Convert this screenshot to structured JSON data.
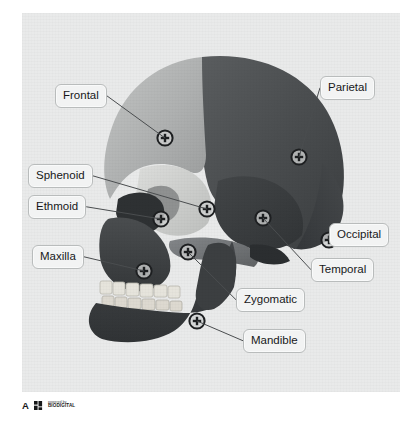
{
  "figure": {
    "panel_letter": "A",
    "attribution": {
      "line1": "powered by",
      "line2": "BIODIGITAL"
    },
    "background_color": "#e9eaea"
  },
  "palette": {
    "frontal": "#b0b2b2",
    "parietal": "#4c4f51",
    "occipital": "#404345",
    "temporal": "#3b3e40",
    "sphenoid": "#cfd0cf",
    "ethmoid": "#8d8f8f",
    "maxilla": "#3f4244",
    "zygomatic": "#6f7274",
    "mandible": "#3a3d3f",
    "teeth": "#e4e2da",
    "label_fill": "#f2f3f3",
    "label_border": "#b9bcbc",
    "leader_line": "#4a4d4f",
    "marker_stroke": "#1d1f21"
  },
  "labels": [
    {
      "id": "frontal",
      "text": "Frontal",
      "box": {
        "x": 55,
        "y": 84
      },
      "anchor": {
        "x": 113,
        "y": 98
      },
      "marker": {
        "x": 143,
        "y": 125
      }
    },
    {
      "id": "parietal",
      "text": "Parietal",
      "box": {
        "x": 320,
        "y": 76
      },
      "anchor": {
        "x": 320,
        "y": 92
      },
      "marker": {
        "x": 277,
        "y": 144
      }
    },
    {
      "id": "sphenoid",
      "text": "Sphenoid",
      "box": {
        "x": 28,
        "y": 164
      },
      "anchor": {
        "x": 100,
        "y": 178
      },
      "marker": {
        "x": 185,
        "y": 196
      }
    },
    {
      "id": "ethmoid",
      "text": "Ethmoid",
      "box": {
        "x": 28,
        "y": 195
      },
      "anchor": {
        "x": 94,
        "y": 209
      },
      "marker": {
        "x": 139,
        "y": 206
      }
    },
    {
      "id": "maxilla",
      "text": "Maxilla",
      "box": {
        "x": 32,
        "y": 245
      },
      "anchor": {
        "x": 90,
        "y": 259
      },
      "marker": {
        "x": 122,
        "y": 258
      }
    },
    {
      "id": "occipital",
      "text": "Occipital",
      "box": {
        "x": 329,
        "y": 223
      },
      "anchor": {
        "x": 329,
        "y": 237
      },
      "marker": {
        "x": 307,
        "y": 227
      }
    },
    {
      "id": "temporal",
      "text": "Temporal",
      "box": {
        "x": 311,
        "y": 258
      },
      "anchor": {
        "x": 311,
        "y": 272
      },
      "marker": {
        "x": 241,
        "y": 205
      }
    },
    {
      "id": "zygomatic",
      "text": "Zygomatic",
      "box": {
        "x": 236,
        "y": 288
      },
      "anchor": {
        "x": 236,
        "y": 302
      },
      "marker": {
        "x": 166,
        "y": 239
      }
    },
    {
      "id": "mandible",
      "text": "Mandible",
      "box": {
        "x": 243,
        "y": 329
      },
      "anchor": {
        "x": 243,
        "y": 343
      },
      "marker": {
        "x": 175,
        "y": 308
      }
    }
  ]
}
